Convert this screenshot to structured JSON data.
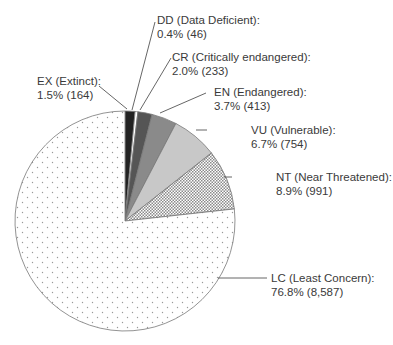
{
  "chart_data": {
    "type": "pie",
    "title": "",
    "start_angle_deg": 0,
    "direction": "clockwise",
    "total": 11188,
    "slices": [
      {
        "key": "EX",
        "label": "EX (Extinct):",
        "value_text": "1.5% (164)",
        "percent": 1.5,
        "count": 164,
        "fill": "#222222",
        "pattern": "solid"
      },
      {
        "key": "DD",
        "label": "DD (Data Deficient):",
        "value_text": "0.4% (46)",
        "percent": 0.4,
        "count": 46,
        "fill": "#ffffff",
        "pattern": "solid"
      },
      {
        "key": "CR",
        "label": "CR (Critically endangered):",
        "value_text": "2.0% (233)",
        "percent": 2.0,
        "count": 233,
        "fill": "#555555",
        "pattern": "solid"
      },
      {
        "key": "EN",
        "label": "EN (Endangered):",
        "value_text": "3.7% (413)",
        "percent": 3.7,
        "count": 413,
        "fill": "#8a8a8a",
        "pattern": "solid"
      },
      {
        "key": "VU",
        "label": "VU (Vulnerable):",
        "value_text": "6.7% (754)",
        "percent": 6.7,
        "count": 754,
        "fill": "#c8c8c8",
        "pattern": "solid"
      },
      {
        "key": "NT",
        "label": "NT (Near Threatened):",
        "value_text": "8.9% (991)",
        "percent": 8.9,
        "count": 991,
        "fill": "#ffffff",
        "pattern": "crosshatch"
      },
      {
        "key": "LC",
        "label": "LC (Least Concern):",
        "value_text": "76.8% (8,587)",
        "percent": 76.8,
        "count": 8587,
        "fill": "#ffffff",
        "pattern": "dots"
      }
    ],
    "legend": "none",
    "labels_position": "outside-with-leader-lines"
  },
  "labels": {
    "ex": {
      "name": "EX (Extinct):",
      "value": "1.5% (164)"
    },
    "dd": {
      "name": "DD (Data Deficient):",
      "value": "0.4% (46)"
    },
    "cr": {
      "name": "CR (Critically endangered):",
      "value": "2.0% (233)"
    },
    "en": {
      "name": "EN (Endangered):",
      "value": "3.7% (413)"
    },
    "vu": {
      "name": "VU (Vulnerable):",
      "value": "6.7% (754)"
    },
    "nt": {
      "name": "NT (Near Threatened):",
      "value": "8.9% (991)"
    },
    "lc": {
      "name": "LC (Least Concern):",
      "value": "76.8% (8,587)"
    }
  }
}
